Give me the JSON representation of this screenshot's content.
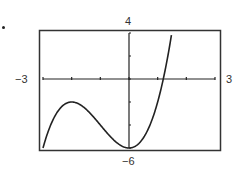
{
  "chart_data": {
    "type": "line",
    "title": "",
    "function": "y = x^3 + 3x^2 - 6",
    "xlabel": "",
    "ylabel": "",
    "xlim": [
      -3,
      3
    ],
    "ylim": [
      -6,
      4
    ],
    "xscale": 1,
    "yscale": 2,
    "grid": false,
    "window_labels": {
      "xmin": "−3",
      "xmax": "3",
      "ymin": "−6",
      "ymax": "4"
    },
    "x": [
      -3,
      -2.5,
      -2,
      -1.5,
      -1,
      -0.5,
      0,
      0.5,
      1,
      1.2,
      1.5,
      1.63
    ],
    "values": [
      -6,
      -3.875,
      -2,
      -3.375,
      -4,
      -5.375,
      -6,
      -5.125,
      -2,
      0.05,
      4.125,
      4.0
    ]
  },
  "labels": {
    "xmin": "−3",
    "xmax": "3",
    "ymin": "−6",
    "ymax": "4"
  },
  "colors": {
    "curve": "#222222",
    "axes": "#222222",
    "frame": "#333333"
  }
}
